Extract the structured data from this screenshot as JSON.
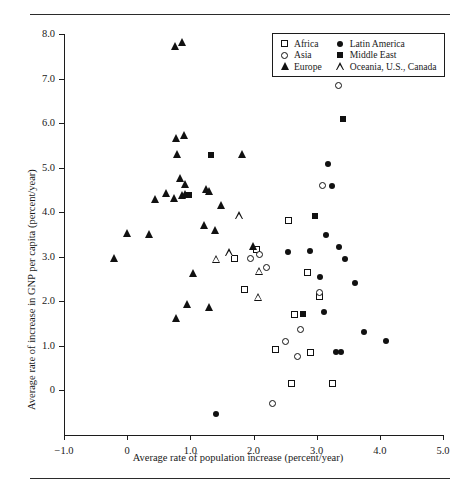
{
  "chart_data": {
    "type": "scatter",
    "title": "",
    "xlabel": "Average rate of population increase (percent/year)",
    "ylabel": "Average rate of increase in GNP per capita (percent/year)",
    "xlim": [
      -1.0,
      5.0
    ],
    "ylim": [
      -1.0,
      8.0
    ],
    "xticks": [
      "-1.0",
      "0",
      "1.0",
      "2.0",
      "3.0",
      "4.0",
      "5.0"
    ],
    "xtick_values": [
      -1.0,
      0,
      1.0,
      2.0,
      3.0,
      4.0,
      5.0
    ],
    "yticks": [
      "0",
      "1.0",
      "2.0",
      "3.0",
      "4.0",
      "5.0",
      "6.0",
      "7.0",
      "8.0"
    ],
    "ytick_values": [
      0,
      1.0,
      2.0,
      3.0,
      4.0,
      5.0,
      6.0,
      7.0,
      8.0
    ],
    "grid": false,
    "legend_position": "top-right",
    "marker_color": "#111111",
    "series": [
      {
        "name": "Africa",
        "marker": "open-square",
        "points": [
          [
            2.55,
            3.8
          ],
          [
            2.85,
            2.65
          ],
          [
            3.05,
            2.1
          ],
          [
            2.65,
            1.7
          ],
          [
            2.35,
            0.9
          ],
          [
            2.9,
            0.85
          ],
          [
            2.6,
            0.15
          ],
          [
            3.25,
            0.15
          ],
          [
            2.05,
            3.15
          ],
          [
            1.85,
            2.25
          ],
          [
            1.7,
            2.95
          ]
        ]
      },
      {
        "name": "Asia",
        "marker": "open-circle",
        "points": [
          [
            3.35,
            6.85
          ],
          [
            3.1,
            4.6
          ],
          [
            3.05,
            2.2
          ],
          [
            2.5,
            1.1
          ],
          [
            2.7,
            0.75
          ],
          [
            2.75,
            1.35
          ],
          [
            2.3,
            -0.3
          ],
          [
            2.1,
            3.05
          ],
          [
            2.2,
            2.75
          ],
          [
            1.95,
            2.95
          ]
        ]
      },
      {
        "name": "Europe",
        "marker": "filled-triangle",
        "points": [
          [
            0.77,
            7.7
          ],
          [
            0.88,
            7.8
          ],
          [
            0.78,
            5.63
          ],
          [
            0.9,
            5.7
          ],
          [
            0.8,
            5.28
          ],
          [
            1.83,
            5.28
          ],
          [
            0.85,
            4.75
          ],
          [
            0.92,
            4.6
          ],
          [
            0.62,
            4.4
          ],
          [
            0.75,
            4.3
          ],
          [
            0.88,
            4.35
          ],
          [
            0.93,
            4.38
          ],
          [
            0.45,
            4.28
          ],
          [
            1.25,
            4.5
          ],
          [
            1.3,
            4.45
          ],
          [
            1.5,
            4.13
          ],
          [
            1.22,
            3.68
          ],
          [
            1.4,
            3.58
          ],
          [
            2.0,
            3.22
          ],
          [
            0.0,
            3.5
          ],
          [
            0.35,
            3.48
          ],
          [
            -0.2,
            2.95
          ],
          [
            1.05,
            2.6
          ],
          [
            0.95,
            1.9
          ],
          [
            1.3,
            1.85
          ],
          [
            0.78,
            1.6
          ]
        ]
      },
      {
        "name": "Latin America",
        "marker": "filled-circle",
        "points": [
          [
            3.42,
            6.1
          ],
          [
            3.18,
            5.08
          ],
          [
            3.25,
            4.58
          ],
          [
            3.15,
            3.48
          ],
          [
            3.35,
            3.22
          ],
          [
            2.9,
            3.12
          ],
          [
            3.45,
            2.95
          ],
          [
            3.05,
            2.55
          ],
          [
            3.6,
            2.4
          ],
          [
            3.12,
            1.75
          ],
          [
            3.3,
            0.85
          ],
          [
            3.38,
            0.85
          ],
          [
            3.75,
            1.3
          ],
          [
            4.1,
            1.1
          ],
          [
            1.4,
            -0.55
          ],
          [
            2.55,
            3.1
          ]
        ]
      },
      {
        "name": "Middle East",
        "marker": "filled-square",
        "points": [
          [
            3.42,
            6.1
          ],
          [
            1.33,
            5.28
          ],
          [
            2.97,
            3.9
          ],
          [
            2.78,
            1.7
          ],
          [
            0.98,
            4.38
          ]
        ]
      },
      {
        "name": "Oceania, U.S., Canada",
        "marker": "open-triangle",
        "points": [
          [
            1.78,
            3.9
          ],
          [
            1.62,
            3.25
          ],
          [
            1.42,
            3.28
          ],
          [
            2.1,
            3.2
          ],
          [
            2.08,
            2.78
          ]
        ]
      }
    ]
  },
  "legend": {
    "entries": [
      {
        "label": "Africa",
        "marker": "open-square"
      },
      {
        "label": "Latin America",
        "marker": "filled-circle"
      },
      {
        "label": "Asia",
        "marker": "open-circle"
      },
      {
        "label": "Middle East",
        "marker": "filled-square"
      },
      {
        "label": "Europe",
        "marker": "filled-triangle"
      },
      {
        "label": "Oceania, U.S., Canada",
        "marker": "open-triangle"
      }
    ]
  }
}
